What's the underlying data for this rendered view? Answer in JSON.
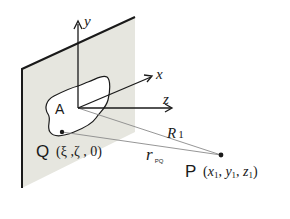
{
  "diagram": {
    "colors": {
      "plate_fill": "#e6e6df",
      "plate_edge": "#1a1a1a",
      "aperture_fill": "#ffffff",
      "axis": "#1a1a1a",
      "ray": "#8a8a8a",
      "text": "#1a1a1a"
    },
    "axes": {
      "y_label": "y",
      "x_label": "x",
      "z_label": "z"
    },
    "aperture": {
      "label": "A"
    },
    "point_q": {
      "label": "Q",
      "coords": "(ξ ,ζ , 0)"
    },
    "point_p": {
      "label": "P",
      "coords_open": "(",
      "x": "x",
      "x_sub": "1",
      "y": "y",
      "y_sub": "1",
      "z": "z",
      "z_sub": "1",
      "coords_close": ")",
      "sep": ", "
    },
    "distances": {
      "r1_label": "R",
      "r1_sub": "1",
      "rpq_label": "r",
      "rpq_sub": "PQ"
    }
  }
}
